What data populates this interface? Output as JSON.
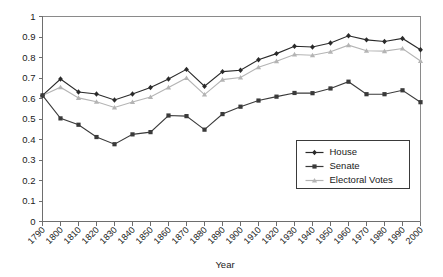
{
  "chart_data": {
    "type": "line",
    "title": "",
    "xlabel": "Year",
    "ylabel": "",
    "grid": false,
    "legend_position": "center-right",
    "xlim": [
      1790,
      2000
    ],
    "ylim": [
      0,
      1
    ],
    "ytick_labels": [
      "1",
      "0.9",
      "0.8",
      "0.7",
      "0.6",
      "0.5",
      "0.4",
      "0.3",
      "0.2",
      "0.1",
      "0"
    ],
    "ytick_values": [
      1,
      0.9,
      0.8,
      0.7,
      0.6,
      0.5,
      0.4,
      0.3,
      0.2,
      0.1,
      0
    ],
    "categories": [
      1790,
      1800,
      1810,
      1820,
      1830,
      1840,
      1850,
      1860,
      1870,
      1880,
      1890,
      1900,
      1910,
      1920,
      1930,
      1940,
      1950,
      1960,
      1970,
      1980,
      1990,
      2000
    ],
    "xtick_labels": [
      "1790",
      "1800",
      "1810",
      "1820",
      "1830",
      "1840",
      "1850",
      "1860",
      "1870",
      "1880",
      "1890",
      "1900",
      "1910",
      "1920",
      "1930",
      "1940",
      "1950",
      "1960",
      "1970",
      "1980",
      "1990",
      "2000"
    ],
    "series": [
      {
        "name": "House",
        "marker": "diamond",
        "color": "#2a2a2a",
        "values": [
          0.615,
          0.695,
          0.632,
          0.622,
          0.593,
          0.622,
          0.654,
          0.695,
          0.742,
          0.66,
          0.731,
          0.738,
          0.789,
          0.819,
          0.855,
          0.851,
          0.871,
          0.906,
          0.886,
          0.878,
          0.893,
          0.838
        ]
      },
      {
        "name": "Senate",
        "marker": "square",
        "color": "#3a3a3a",
        "values": [
          0.615,
          0.503,
          0.472,
          0.412,
          0.377,
          0.425,
          0.436,
          0.517,
          0.514,
          0.448,
          0.524,
          0.56,
          0.59,
          0.609,
          0.627,
          0.626,
          0.649,
          0.682,
          0.621,
          0.621,
          0.64,
          0.582
        ]
      },
      {
        "name": "Electoral Votes",
        "marker": "triangle",
        "color": "#b4b4b4",
        "values": [
          0.615,
          0.655,
          0.603,
          0.584,
          0.556,
          0.583,
          0.607,
          0.654,
          0.7,
          0.619,
          0.692,
          0.702,
          0.752,
          0.782,
          0.815,
          0.811,
          0.828,
          0.86,
          0.833,
          0.831,
          0.844,
          0.783
        ]
      }
    ]
  },
  "legend": {
    "entries": [
      {
        "label": "House"
      },
      {
        "label": "Senate"
      },
      {
        "label": "Electoral Votes"
      }
    ]
  }
}
